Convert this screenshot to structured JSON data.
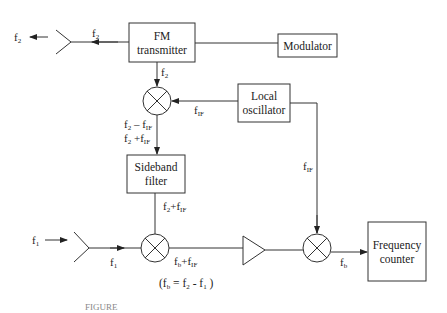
{
  "diagram": {
    "blocks": {
      "fm_transmitter": {
        "line1": "FM",
        "line2": "transmitter"
      },
      "modulator": {
        "label": "Modulator"
      },
      "local_oscillator": {
        "line1": "Local",
        "line2": "oscillator"
      },
      "sideband_filter": {
        "line1": "Sideband",
        "line2": "filter"
      },
      "frequency_counter": {
        "line1": "Frequency",
        "line2": "counter"
      }
    },
    "signals": {
      "f2_out": {
        "base": "f",
        "sub": "2"
      },
      "f2_tx": {
        "base": "f",
        "sub": "2"
      },
      "f2_down": {
        "base": "f",
        "sub": "2"
      },
      "fif_lo": {
        "base": "f",
        "sub": "IF"
      },
      "mix1_out_a": {
        "base": "f",
        "sub": "2",
        "op": " – f",
        "sub2": "IF"
      },
      "mix1_out_b": {
        "base": "f",
        "sub": "2",
        "op": " +f",
        "sub2": "IF"
      },
      "filter_out": {
        "base": "f",
        "sub": "2",
        "op": "+f",
        "sub2": "IF"
      },
      "fif_right": {
        "base": "f",
        "sub": "IF"
      },
      "f1_in": {
        "base": "f",
        "sub": "1"
      },
      "f1_ant": {
        "base": "f",
        "sub": "1"
      },
      "mix2_out": {
        "base": "f",
        "sub": "b",
        "op": "+f",
        "sub2": "IF"
      },
      "fb_out": {
        "base": "f",
        "sub": "b"
      }
    },
    "equation": {
      "open": "(f",
      "s1": "b",
      "mid1": " = f",
      "s2": "2",
      "mid2": " - f",
      "s3": "1",
      "close": " )"
    },
    "caption": "FIGURE"
  }
}
